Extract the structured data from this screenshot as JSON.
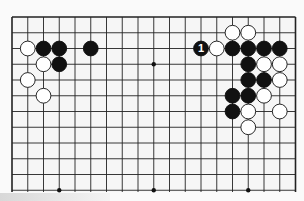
{
  "game": "Go",
  "board": {
    "columns": 19,
    "visible_rows": 12,
    "origin_x": 12,
    "origin_y": 17,
    "step_x": 15.75,
    "step_y": 15.75,
    "line_color": "#222222",
    "background": "#f6f6f6",
    "open_bottom": true
  },
  "star_points": [
    [
      3,
      3
    ],
    [
      9,
      3
    ],
    [
      15,
      3
    ],
    [
      3,
      11
    ],
    [
      9,
      11
    ],
    [
      15,
      11
    ]
  ],
  "stones": [
    {
      "color": "white",
      "col": 1,
      "row": 2
    },
    {
      "color": "black",
      "col": 2,
      "row": 2
    },
    {
      "color": "black",
      "col": 3,
      "row": 2
    },
    {
      "color": "black",
      "col": 5,
      "row": 2
    },
    {
      "color": "white",
      "col": 2,
      "row": 3
    },
    {
      "color": "black",
      "col": 3,
      "row": 3
    },
    {
      "color": "white",
      "col": 1,
      "row": 4
    },
    {
      "color": "white",
      "col": 2,
      "row": 5
    },
    {
      "color": "white",
      "col": 14,
      "row": 1
    },
    {
      "color": "white",
      "col": 15,
      "row": 1
    },
    {
      "color": "black",
      "col": 12,
      "row": 2,
      "label": "1"
    },
    {
      "color": "white",
      "col": 13,
      "row": 2
    },
    {
      "color": "black",
      "col": 14,
      "row": 2
    },
    {
      "color": "black",
      "col": 15,
      "row": 2
    },
    {
      "color": "black",
      "col": 16,
      "row": 2
    },
    {
      "color": "black",
      "col": 17,
      "row": 2
    },
    {
      "color": "black",
      "col": 15,
      "row": 3
    },
    {
      "color": "white",
      "col": 16,
      "row": 3
    },
    {
      "color": "white",
      "col": 17,
      "row": 3
    },
    {
      "color": "black",
      "col": 15,
      "row": 4
    },
    {
      "color": "black",
      "col": 16,
      "row": 4
    },
    {
      "color": "white",
      "col": 17,
      "row": 4
    },
    {
      "color": "black",
      "col": 14,
      "row": 5
    },
    {
      "color": "black",
      "col": 15,
      "row": 5
    },
    {
      "color": "white",
      "col": 16,
      "row": 5
    },
    {
      "color": "black",
      "col": 14,
      "row": 6
    },
    {
      "color": "white",
      "col": 15,
      "row": 6
    },
    {
      "color": "white",
      "col": 17,
      "row": 6
    },
    {
      "color": "white",
      "col": 15,
      "row": 7
    }
  ],
  "move_labels": [
    {
      "text": "1",
      "col": 12,
      "row": 2
    }
  ]
}
